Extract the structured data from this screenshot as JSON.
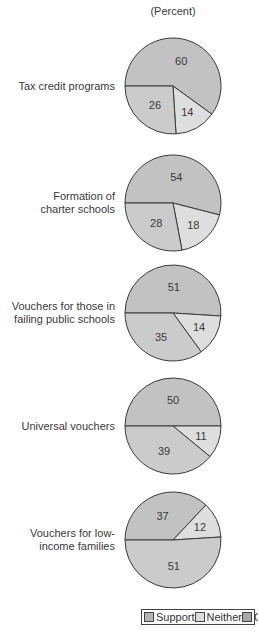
{
  "chart_data": {
    "type": "pie",
    "unit_label": "(Percent)",
    "legend": [
      "Support",
      "Neither",
      "Oppose"
    ],
    "colors": {
      "Support": "#bdbdbd",
      "Neither": "#dcdcdc",
      "Oppose": "#c8c8c8"
    },
    "charts": [
      {
        "label": "Tax credit programs",
        "support": 60,
        "neither": 14,
        "oppose": 26
      },
      {
        "label": "Formation of charter schools",
        "support": 54,
        "neither": 18,
        "oppose": 28
      },
      {
        "label": "Vouchers for those in failing public schools",
        "support": 51,
        "neither": 14,
        "oppose": 35
      },
      {
        "label": "Universal vouchers",
        "support": 50,
        "neither": 11,
        "oppose": 39
      },
      {
        "label": "Vouchers for low-income families",
        "support": 37,
        "neither": 12,
        "oppose": 51
      }
    ]
  },
  "labels": [
    [
      "Tax credit programs"
    ],
    [
      "Formation of",
      "charter schools"
    ],
    [
      "Vouchers for those in",
      "failing public schools"
    ],
    [
      "Universal vouchers"
    ],
    [
      "Vouchers for low-",
      "income families"
    ]
  ]
}
